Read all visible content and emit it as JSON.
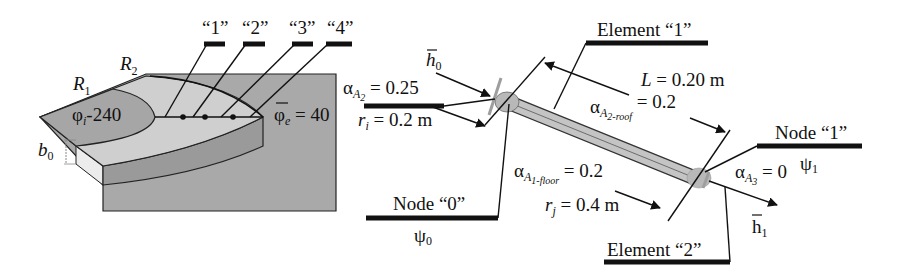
{
  "left_figure": {
    "labels": {
      "R1": "R",
      "R1_sub": "1",
      "R2": "R",
      "R2_sub": "2",
      "b0": "b",
      "b0_sub": "0",
      "phi_i": "φ",
      "phi_i_sub": "i",
      "phi_i_value": "-240",
      "phi_e": "φ",
      "phi_e_sub": "e",
      "phi_e_value": " = 40"
    },
    "points": [
      "“1”",
      "“2”",
      "“3”",
      "“4”"
    ],
    "colors": {
      "base": "#a9a9a9",
      "top_light": "#cfcfcf",
      "inner_region": "#a6a6a6",
      "side_band": "#9a9a9a",
      "front_face": "#ececec"
    }
  },
  "right_figure": {
    "element1": "Element “1”",
    "element2": "Element “2”",
    "node0": "Node “0”",
    "node1": "Node “1”",
    "psi0": "ψ",
    "psi0_sub": "0",
    "psi1": "ψ",
    "psi1_sub": "1",
    "h0": "h",
    "h0_sub": "0",
    "h1": "h",
    "h1_sub": "1",
    "alpha_A2": {
      "sym": "α",
      "A": "A",
      "sub": "2",
      "value": " = 0.25"
    },
    "r_i": {
      "sym": "r",
      "sub": "i",
      "value": " = 0.2 m"
    },
    "L": {
      "sym": "L",
      "value": " = 0.20 m"
    },
    "alpha_A2_roof": {
      "sym": "α",
      "A": "A",
      "sub": "2-roof",
      "value": " = 0.2"
    },
    "alpha_A1_floor": {
      "sym": "α",
      "A": "A",
      "sub": "1-floor",
      "value": " = 0.2"
    },
    "r_j": {
      "sym": "r",
      "sub": "j",
      "value": " = 0.4 m"
    },
    "alpha_A3": {
      "sym": "α",
      "A": "A",
      "sub": "3",
      "value": " = 0"
    },
    "colors": {
      "rod": "#c4c4c4",
      "node_fill": "#b8b8b8",
      "boundary": "#9e9e9e"
    }
  }
}
